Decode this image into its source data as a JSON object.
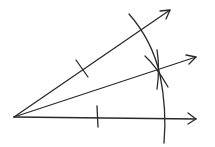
{
  "diagram": {
    "stroke_color": "#2a2a2a",
    "background": "#ffffff",
    "vertex": [
      14,
      117
    ],
    "rays": [
      {
        "name": "upper-ray",
        "end": [
          170,
          10
        ]
      },
      {
        "name": "bisector-ray",
        "end": [
          196,
          57
        ]
      },
      {
        "name": "lower-ray",
        "end": [
          196,
          119
        ]
      }
    ],
    "tick_marks": [
      {
        "name": "upper-ray-tick",
        "at": [
          82,
          68
        ]
      },
      {
        "name": "lower-ray-tick",
        "at": [
          98,
          118
        ]
      }
    ],
    "main_arc": "large compass arc crossing upper and lower rays",
    "intersection_arcs": "two small compass arcs intersecting on bisector near (158,69)"
  }
}
